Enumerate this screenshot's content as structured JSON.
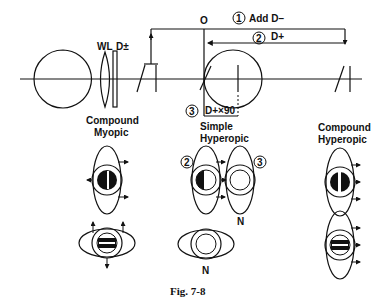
{
  "figure": {
    "caption": "Fig. 7-8",
    "labels": {
      "wl": "WL",
      "d_pm": "D±",
      "origin": "O",
      "step1_num": "1",
      "step1_text": "Add D−",
      "step2_num": "2",
      "step2_text": "D+",
      "step3_num": "3",
      "step3_text": "D+×90"
    },
    "groups": [
      {
        "id": "compound-myopic",
        "line1": "Compound",
        "line2": "Myopic"
      },
      {
        "id": "simple-hyperopic",
        "line1": "Simple",
        "line2": "Hyperopic",
        "marker_left": "2",
        "marker_right": "3",
        "neutral_top": "N",
        "neutral_bottom": "N"
      },
      {
        "id": "compound-hyperopic",
        "line1": "Compound",
        "line2": "Hyperopic"
      }
    ]
  }
}
